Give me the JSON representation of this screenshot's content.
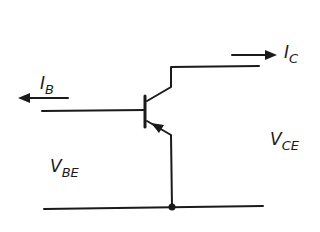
{
  "diagram": {
    "type": "transistor-circuit",
    "transistor": "PNP bipolar junction transistor",
    "labels": {
      "base_current": {
        "main": "I",
        "sub": "B"
      },
      "collector_current": {
        "main": "I",
        "sub": "C"
      },
      "base_emitter_voltage": {
        "main": "V",
        "sub": "BE"
      },
      "collector_emitter_voltage": {
        "main": "V",
        "sub": "CE"
      }
    },
    "arrows": {
      "base_current_direction": "left",
      "collector_current_direction": "right",
      "emitter_arrow_direction": "into base"
    },
    "colors": {
      "line": "#1a1a1a",
      "background": "#ffffff"
    }
  }
}
